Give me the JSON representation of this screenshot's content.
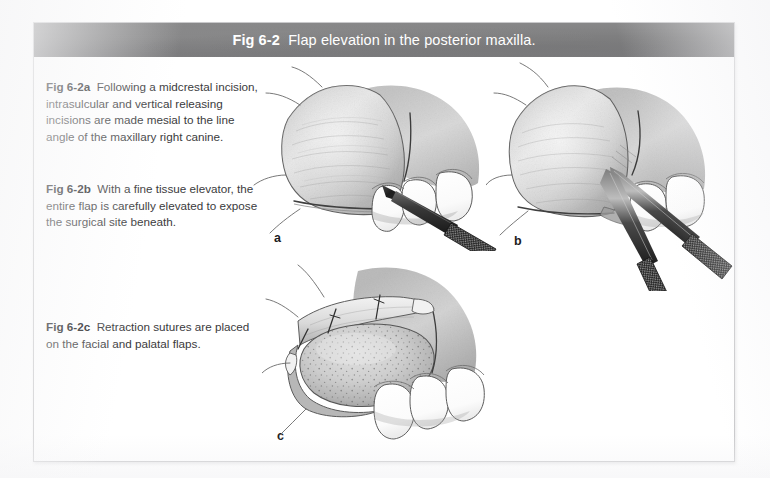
{
  "figure": {
    "id": "Fig 6-2",
    "title_number": "Fig 6-2",
    "title_text": "Flap elevation in the posterior maxilla.",
    "header_color": "#818182",
    "header_text_color": "#ffffff",
    "frame_border_color": "#c9c9cb",
    "page_background": "#ffffff",
    "illustration_style": "grayscale pencil rendering"
  },
  "captions": {
    "a": {
      "label": "Fig 6-2a",
      "text": "Following a midcrestal incision, intrasulcular and vertical releasing incisions are made mesial to the line angle of the maxillary right canine."
    },
    "b": {
      "label": "Fig 6-2b",
      "text": "With a fine tissue elevator, the entire flap is carefully elevated to expose the surgical site beneath."
    },
    "c": {
      "label": "Fig 6-2c",
      "text": "Retraction sutures are placed on the facial and palatal flaps."
    }
  },
  "panels": [
    {
      "key": "a",
      "label": "a",
      "subject": "posterior maxilla with midcrestal and vertical releasing incisions, scalpel in place",
      "instruments": [
        "scalpel"
      ],
      "teeth_visible": 3
    },
    {
      "key": "b",
      "label": "b",
      "subject": "flap elevated with fine tissue elevator",
      "instruments": [
        "periosteal elevator",
        "periosteal elevator"
      ],
      "teeth_visible": 2
    },
    {
      "key": "c",
      "label": "c",
      "subject": "exposed alveolar bone with retraction sutures on facial and palatal flaps",
      "instruments": [],
      "teeth_visible": 3
    }
  ]
}
